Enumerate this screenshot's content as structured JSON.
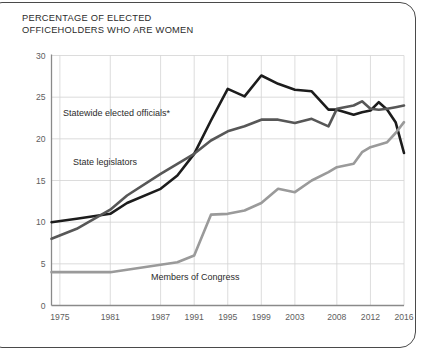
{
  "card": {
    "name": "chart-card",
    "border_color": "#4a4a4a",
    "background": "#ffffff"
  },
  "chart_data": {
    "type": "line",
    "title": "PERCENTAGE OF ELECTED\nOFFICEHOLDERS WHO ARE WOMEN",
    "xlabel": "",
    "ylabel": "",
    "xlim": [
      1974,
      2016
    ],
    "ylim": [
      0,
      30
    ],
    "grid": true,
    "legend_position": "inline-annotations",
    "yticks": [
      "0",
      "5",
      "10",
      "15",
      "20",
      "25",
      "30"
    ],
    "ytick_values": [
      0,
      5,
      10,
      15,
      20,
      25,
      30
    ],
    "xticks": [
      "1975",
      "1981",
      "1987",
      "1991",
      "1995",
      "1999",
      "2003",
      "2008",
      "2012",
      "2016"
    ],
    "xtick_values": [
      1975,
      1981,
      1987,
      1991,
      1995,
      1999,
      2003,
      2008,
      2012,
      2016
    ],
    "series": [
      {
        "name": "Statewide elected officials*",
        "label": "Statewide elected officials*",
        "color": "#1c1c1c",
        "width": 2.6,
        "x": [
          1974,
          1977,
          1981,
          1983,
          1987,
          1989,
          1991,
          1993,
          1995,
          1997,
          1999,
          2001,
          2003,
          2005,
          2007,
          2008,
          2010,
          2011,
          2012,
          2013,
          2014,
          2015,
          2016
        ],
        "values": [
          10.0,
          10.4,
          11.0,
          12.3,
          14.0,
          15.6,
          18.2,
          22.2,
          26.0,
          25.1,
          27.6,
          26.6,
          25.9,
          25.7,
          23.5,
          23.5,
          22.9,
          23.2,
          23.4,
          24.4,
          23.5,
          22.0,
          18.3
        ]
      },
      {
        "name": "State legislators",
        "label": "State legislators",
        "color": "#575757",
        "width": 2.6,
        "x": [
          1974,
          1977,
          1981,
          1983,
          1987,
          1989,
          1991,
          1993,
          1995,
          1997,
          1999,
          2001,
          2003,
          2005,
          2007,
          2008,
          2010,
          2011,
          2012,
          2013,
          2014,
          2015,
          2016
        ],
        "values": [
          8.0,
          9.2,
          11.5,
          13.2,
          15.8,
          17.0,
          18.2,
          19.8,
          20.9,
          21.5,
          22.3,
          22.3,
          21.9,
          22.4,
          21.5,
          23.6,
          24.0,
          24.5,
          23.6,
          23.5,
          23.6,
          23.8,
          24.0
        ]
      },
      {
        "name": "Members of Congress",
        "label": "Members of Congress",
        "color": "#9a9a9a",
        "width": 2.6,
        "x": [
          1974,
          1977,
          1981,
          1983,
          1987,
          1989,
          1991,
          1993,
          1995,
          1997,
          1999,
          2001,
          2003,
          2005,
          2007,
          2008,
          2010,
          2011,
          2012,
          2013,
          2014,
          2015,
          2016
        ],
        "values": [
          4.0,
          4.0,
          4.0,
          4.3,
          4.9,
          5.2,
          6.0,
          10.9,
          11.0,
          11.4,
          12.3,
          14.0,
          13.6,
          15.0,
          16.0,
          16.6,
          17.0,
          18.4,
          19.0,
          19.3,
          19.6,
          20.7,
          22.0
        ]
      }
    ],
    "annotations": [
      {
        "text": "Statewide elected officials*",
        "x_px": 63,
        "y_px": 116
      },
      {
        "text": "State legislators",
        "x_px": 73,
        "y_px": 165
      },
      {
        "text": "Members of Congress",
        "x_px": 151,
        "y_px": 280
      }
    ]
  }
}
